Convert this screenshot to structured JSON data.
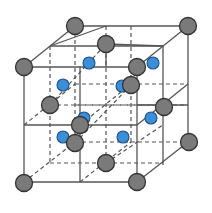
{
  "diagram": {
    "title": "",
    "type": "crystal-lattice-unit-cell",
    "colors": {
      "large_atom": "#7a7a7a",
      "small_atom": "#3a8fd8",
      "edge": "#555555",
      "background": "#ffffff"
    },
    "solid_lines": [
      [
        24,
        67,
        137,
        67
      ],
      [
        137,
        67,
        137,
        182
      ],
      [
        137,
        182,
        24,
        182
      ],
      [
        24,
        182,
        24,
        67
      ],
      [
        75,
        26,
        188,
        26
      ],
      [
        188,
        26,
        188,
        142
      ],
      [
        24,
        67,
        75,
        26
      ],
      [
        137,
        67,
        188,
        26
      ],
      [
        137,
        182,
        188,
        142
      ],
      [
        80,
        67,
        80,
        182
      ],
      [
        24,
        125,
        137,
        125
      ],
      [
        50,
        46,
        163,
        46
      ],
      [
        106,
        26,
        50,
        46
      ],
      [
        106,
        67,
        106,
        44
      ],
      [
        137,
        125,
        188,
        84
      ],
      [
        163,
        46,
        163,
        165
      ],
      [
        81,
        26,
        81,
        26
      ],
      [
        137,
        105,
        188,
        105
      ],
      [
        106,
        44,
        163,
        46
      ]
    ],
    "dashed_lines": [
      [
        75,
        26,
        75,
        142
      ],
      [
        75,
        142,
        188,
        142
      ],
      [
        24,
        182,
        75,
        142
      ],
      [
        50,
        46,
        50,
        163
      ],
      [
        50,
        163,
        163,
        163
      ],
      [
        106,
        26,
        106,
        163
      ],
      [
        75,
        84,
        188,
        84
      ],
      [
        75,
        105,
        188,
        105
      ],
      [
        50,
        105,
        163,
        105
      ],
      [
        24,
        125,
        75,
        84
      ],
      [
        80,
        182,
        131,
        142
      ],
      [
        80,
        125,
        131,
        84
      ],
      [
        106,
        163,
        163,
        125
      ],
      [
        131,
        26,
        131,
        142
      ],
      [
        50,
        105,
        106,
        44
      ],
      [
        75,
        143,
        131,
        85
      ]
    ],
    "large_atoms": [
      {
        "id": "back-top-left",
        "x": 75,
        "y": 26
      },
      {
        "id": "back-top-right",
        "x": 188,
        "y": 26
      },
      {
        "id": "top-face-center",
        "x": 106,
        "y": 44
      },
      {
        "id": "front-top-left",
        "x": 24,
        "y": 67
      },
      {
        "id": "front-top-right",
        "x": 137,
        "y": 67
      },
      {
        "id": "back-face-center",
        "x": 131,
        "y": 85
      },
      {
        "id": "left-face-center",
        "x": 50,
        "y": 105
      },
      {
        "id": "right-face-center",
        "x": 164,
        "y": 107
      },
      {
        "id": "front-face-center",
        "x": 80,
        "y": 125
      },
      {
        "id": "back-bottom-right",
        "x": 189,
        "y": 142
      },
      {
        "id": "bottom-hidden",
        "x": 75,
        "y": 143
      },
      {
        "id": "bottom-face-center",
        "x": 106,
        "y": 163
      },
      {
        "id": "front-bottom-left",
        "x": 24,
        "y": 183
      },
      {
        "id": "front-bottom-right",
        "x": 137,
        "y": 182
      }
    ],
    "small_atoms": [
      {
        "id": "tetra-1",
        "x": 89,
        "y": 63
      },
      {
        "id": "tetra-2",
        "x": 153,
        "y": 63
      },
      {
        "id": "tetra-3",
        "x": 63,
        "y": 85
      },
      {
        "id": "tetra-4",
        "x": 122,
        "y": 86
      },
      {
        "id": "tetra-5",
        "x": 84,
        "y": 118
      },
      {
        "id": "tetra-6",
        "x": 151,
        "y": 118
      },
      {
        "id": "tetra-7",
        "x": 63,
        "y": 137
      },
      {
        "id": "tetra-8",
        "x": 123,
        "y": 137
      }
    ],
    "atom_radius": {
      "large": 8.5,
      "small": 6
    }
  }
}
